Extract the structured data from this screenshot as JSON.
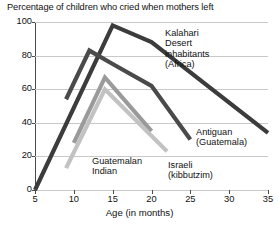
{
  "chart_data": {
    "type": "line",
    "title": "Percentage of children who cried when mothers left",
    "xlabel": "Age (in months)",
    "ylabel": "",
    "xlim": [
      5,
      35
    ],
    "ylim": [
      0,
      100
    ],
    "xticks": [
      5,
      10,
      15,
      20,
      25,
      30,
      35
    ],
    "yticks": [
      0,
      20,
      40,
      60,
      80,
      100
    ],
    "grid": "horizontal",
    "legend": "inline-labels",
    "series": [
      {
        "name": "Kalahari Desert inhabitants (Africa)",
        "label_text": "Kalahari\nDesert\ninhabitants\n(Africa)",
        "color": "#3c3c3c",
        "points": [
          [
            5,
            0
          ],
          [
            15,
            98
          ],
          [
            20,
            88
          ],
          [
            35,
            34
          ]
        ]
      },
      {
        "name": "Antiguan (Guatemala)",
        "label_text": "Antiguan\n(Guatemala)",
        "color": "#4a4a4a",
        "points": [
          [
            9,
            54
          ],
          [
            12,
            83
          ],
          [
            15,
            75
          ],
          [
            20,
            62
          ],
          [
            25,
            30
          ]
        ]
      },
      {
        "name": "Guatemalan Indian",
        "label_text": "Guatemalan\nIndian",
        "color": "#9a9a9a",
        "points": [
          [
            10,
            28
          ],
          [
            14,
            67
          ],
          [
            20,
            35
          ]
        ]
      },
      {
        "name": "Israeli (kibbutzim)",
        "label_text": "Israeli\n(kibbutzim)",
        "color": "#c2c2c2",
        "points": [
          [
            9,
            13
          ],
          [
            14,
            60
          ],
          [
            22,
            23
          ]
        ]
      }
    ]
  },
  "labels": {
    "kalahari": "Kalahari\nDesert\ninhabitants\n(Africa)",
    "antiguan": "Antiguan\n(Guatemala)",
    "guatemalan": "Guatemalan\nIndian",
    "israeli": "Israeli\n(kibbutzim)"
  }
}
